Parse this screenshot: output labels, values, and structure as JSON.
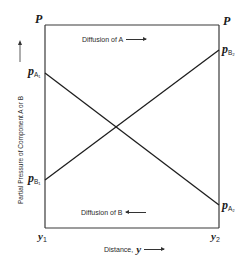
{
  "diagram": {
    "type": "partial-pressure-profile",
    "corner_labels": {
      "top_left": "P",
      "top_right": "P"
    },
    "left_labels": {
      "pa1": {
        "base": "p",
        "sub": "A₁"
      },
      "pb1": {
        "base": "p",
        "sub": "B₁"
      }
    },
    "right_labels": {
      "pb2": {
        "base": "p",
        "sub": "B₂"
      },
      "pa2": {
        "base": "p",
        "sub": "A₂"
      }
    },
    "x_ticks": {
      "start": {
        "base": "y",
        "sub": "1"
      },
      "end": {
        "base": "y",
        "sub": "2"
      }
    },
    "annotations": {
      "diffusion_a": "Diffusion of A",
      "diffusion_a_direction": "right",
      "diffusion_b": "Diffusion of B",
      "diffusion_b_direction": "left"
    },
    "axes": {
      "xlabel_text": "Distance,",
      "xlabel_var": "y",
      "ylabel": "Partial Pressure of Component A or B"
    },
    "lines": [
      {
        "name": "Component A",
        "from": "p_A1 at y1",
        "to": "p_A2 at y2",
        "trend": "decreasing"
      },
      {
        "name": "Component B",
        "from": "p_B1 at y1",
        "to": "p_B2 at y2",
        "trend": "increasing"
      }
    ],
    "colors": {
      "line": "#1e1e1e",
      "frame": "#3a3a3a",
      "background": "#ffffff"
    }
  }
}
